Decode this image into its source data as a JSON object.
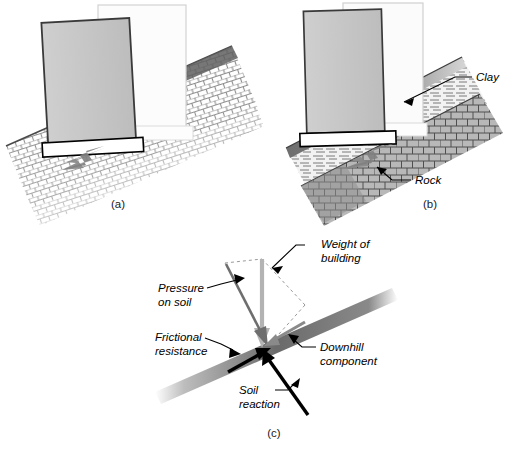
{
  "figure": {
    "panels": [
      {
        "id": "a",
        "caption": "(a)",
        "description": "Building tilting on uniform soil slope",
        "annotations": []
      },
      {
        "id": "b",
        "caption": "(b)",
        "description": "Building on clay layer over rock slope",
        "annotations": [
          {
            "name": "clay",
            "text": "Clay"
          },
          {
            "name": "rock",
            "text": "Rock"
          }
        ]
      },
      {
        "id": "c",
        "caption": "(c)",
        "description": "Force vector diagram at footing on slope",
        "annotations": [
          {
            "name": "weight-of-building",
            "text": "Weight of\nbuilding",
            "line1": "Weight of",
            "line2": "building"
          },
          {
            "name": "pressure-on-soil",
            "text": "Pressure\non soil",
            "line1": "Pressure",
            "line2": "on soil"
          },
          {
            "name": "frictional-resistance",
            "text": "Frictional\nresistance",
            "line1": "Frictional",
            "line2": "resistance"
          },
          {
            "name": "downhill-component",
            "text": "Downhill\ncomponent",
            "line1": "Downhill",
            "line2": "component"
          },
          {
            "name": "soil-reaction",
            "text": "Soil\nreaction",
            "line1": "Soil",
            "line2": "reaction"
          }
        ]
      }
    ]
  },
  "colors": {
    "background": "#ffffff",
    "building_fill": "#c8c8c8",
    "building_stroke": "#333333",
    "ghost_fill": "#fbfbfb",
    "ghost_stroke": "#cccccc",
    "footing_fill": "#ffffff",
    "footing_stroke": "#000000",
    "soil_hatch": "#7d7d7d",
    "clay_fill": "#e8e8e8",
    "rock_fill": "#b4b4b4",
    "arrow_gray": "#8c8c8c",
    "weight_arrow": "#b0b0b0",
    "pressure_arrow": "#6e6e6e",
    "reaction_arrow": "#000000",
    "slope_bar_dark": "#4a4a4a",
    "label_text": "#000000"
  }
}
